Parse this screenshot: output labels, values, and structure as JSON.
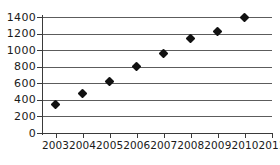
{
  "chart_data": {
    "type": "scatter",
    "title": "",
    "subtitle": "",
    "xlabel": "",
    "ylabel": "",
    "x": [
      2003,
      2004,
      2005,
      2006,
      2007,
      2008,
      2009,
      2010
    ],
    "values": [
      340,
      480,
      620,
      800,
      960,
      1140,
      1230,
      1400
    ],
    "series": [
      {
        "name": "",
        "values": [
          340,
          480,
          620,
          800,
          960,
          1140,
          1230,
          1400
        ]
      }
    ],
    "points": [
      {
        "x": 2003,
        "y": 340
      },
      {
        "x": 2004,
        "y": 480
      },
      {
        "x": 2005,
        "y": 620
      },
      {
        "x": 2006,
        "y": 800
      },
      {
        "x": 2007,
        "y": 960
      },
      {
        "x": 2008,
        "y": 1140
      },
      {
        "x": 2009,
        "y": 1230
      },
      {
        "x": 2010,
        "y": 1400
      }
    ],
    "ylim": [
      0,
      1400
    ],
    "xlim": [
      2002.5,
      2011
    ],
    "ytick_labels": [
      "0",
      "200",
      "400",
      "600",
      "800",
      "1000",
      "1200",
      "1400"
    ],
    "ytick_values": [
      0,
      200,
      400,
      600,
      800,
      1000,
      1200,
      1400
    ],
    "xtick_labels": [
      "2003",
      "2004",
      "2005",
      "2006",
      "2007",
      "2008",
      "2009",
      "2010",
      "2011"
    ],
    "xtick_values": [
      2003,
      2004,
      2005,
      2006,
      2007,
      2008,
      2009,
      2010,
      2011
    ],
    "grid": true,
    "grid_axis": "y",
    "legend": false,
    "legend_position": "none",
    "marker": "diamond",
    "marker_color": "#111111",
    "gridline_color": "#5c5c5c",
    "axis_color": "#3a3a3a",
    "background_color": "#ffffff",
    "annotations": []
  }
}
